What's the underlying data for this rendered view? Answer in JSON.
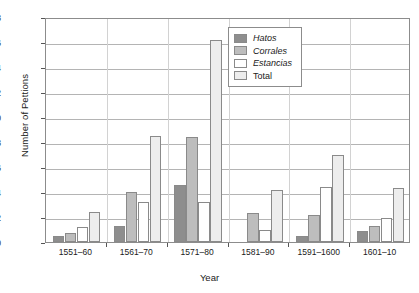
{
  "chart_data": {
    "type": "bar",
    "title": "",
    "xlabel": "Year",
    "ylabel": "Number of Pettions",
    "ylim": [
      0,
      18
    ],
    "ytick_step": 2,
    "yticks": [
      0,
      2,
      4,
      6,
      8,
      10,
      12,
      14,
      16,
      18
    ],
    "grid": "horizontal",
    "legend_position": "top-right",
    "categories": [
      "1551–60",
      "1561–70",
      "1571–80",
      "1581–90",
      "1591–1600",
      "1601–10"
    ],
    "series": [
      {
        "name": "Hatos",
        "color": "#8e8e8e",
        "values": [
          0.5,
          1.3,
          4.6,
          0.0,
          0.5,
          0.9
        ]
      },
      {
        "name": "Corrales",
        "color": "#bdbdbd",
        "values": [
          0.7,
          4.0,
          8.4,
          2.3,
          2.2,
          1.3
        ]
      },
      {
        "name": "Estancias",
        "color": "#ffffff",
        "values": [
          1.2,
          3.2,
          3.2,
          1.0,
          4.4,
          1.9
        ]
      },
      {
        "name": "Total",
        "color": "#ededed",
        "values": [
          2.4,
          8.5,
          16.2,
          4.2,
          7.0,
          4.3
        ]
      }
    ]
  },
  "legend": {
    "items": [
      {
        "label": "Hatos"
      },
      {
        "label": "Corrales"
      },
      {
        "label": "Estancias"
      },
      {
        "label": "Total"
      }
    ]
  }
}
